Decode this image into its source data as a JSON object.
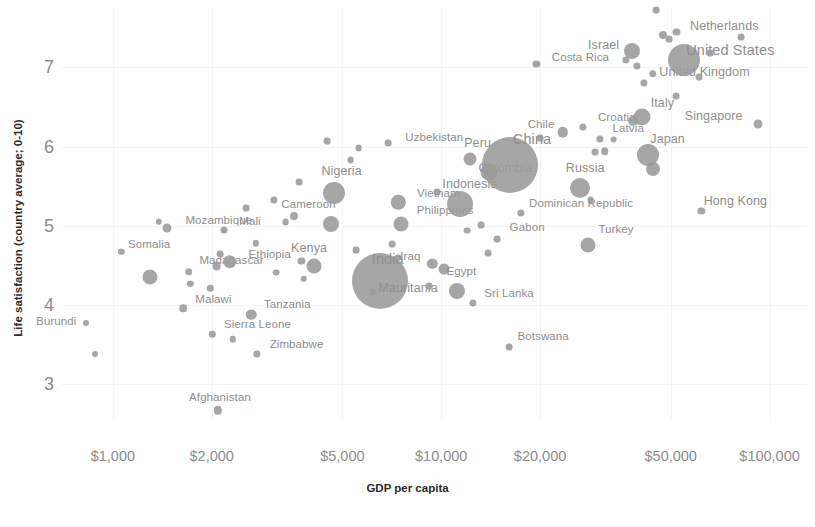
{
  "chart_data": {
    "type": "scatter",
    "title": "",
    "xlabel": "GDP per capita",
    "ylabel": "Life satisfaction (country average; 0-10)",
    "x_scale": "log",
    "xticks": [
      "$1,000",
      "$2,000",
      "$5,000",
      "$10,000",
      "$20,000",
      "$50,000",
      "$100,000"
    ],
    "xtick_values": [
      1000,
      2000,
      5000,
      10000,
      20000,
      50000,
      100000
    ],
    "yticks": [
      "3",
      "4",
      "5",
      "6",
      "7"
    ],
    "ytick_values": [
      3,
      4,
      5,
      6,
      7
    ],
    "xlim": [
      700,
      130000
    ],
    "ylim": [
      2.55,
      7.75
    ],
    "grid": true,
    "legend": null,
    "marker_color": "#9a9a9a",
    "label_color": "#8e8e8e",
    "size_encoding": "population",
    "points": [
      {
        "label": "Burundi",
        "gdp": 830,
        "life": 3.78,
        "r": 3.0,
        "lx": -30,
        "ly": -2,
        "cls": ""
      },
      {
        "label": "",
        "gdp": 880,
        "life": 3.38,
        "r": 3.0,
        "lx": 0,
        "ly": 0,
        "cls": ""
      },
      {
        "label": "Somalia",
        "gdp": 1060,
        "life": 4.67,
        "r": 3.2,
        "lx": 28,
        "ly": -8,
        "cls": ""
      },
      {
        "label": "",
        "gdp": 1300,
        "life": 4.35,
        "r": 7.5,
        "lx": 0,
        "ly": 0,
        "cls": ""
      },
      {
        "label": "Mozambique",
        "gdp": 1460,
        "life": 4.97,
        "r": 4.5,
        "lx": 52,
        "ly": -8,
        "cls": ""
      },
      {
        "label": "",
        "gdp": 1380,
        "life": 5.05,
        "r": 3.2,
        "lx": 0,
        "ly": 0,
        "cls": ""
      },
      {
        "label": "Malawi",
        "gdp": 1640,
        "life": 3.96,
        "r": 3.8,
        "lx": 30,
        "ly": -9,
        "cls": ""
      },
      {
        "label": "Madagascar",
        "gdp": 1700,
        "life": 4.42,
        "r": 3.8,
        "lx": 43,
        "ly": -12,
        "cls": ""
      },
      {
        "label": "",
        "gdp": 1720,
        "life": 4.27,
        "r": 3.2,
        "lx": 0,
        "ly": 0,
        "cls": ""
      },
      {
        "label": "",
        "gdp": 1980,
        "life": 4.21,
        "r": 3.2,
        "lx": 0,
        "ly": 0,
        "cls": ""
      },
      {
        "label": "Mali",
        "gdp": 2180,
        "life": 4.95,
        "r": 3.5,
        "lx": 26,
        "ly": -9,
        "cls": ""
      },
      {
        "label": "Ethiopia",
        "gdp": 2270,
        "life": 4.55,
        "r": 6.8,
        "lx": 40,
        "ly": -8,
        "cls": ""
      },
      {
        "label": "",
        "gdp": 2120,
        "life": 4.64,
        "r": 3.4,
        "lx": 0,
        "ly": 0,
        "cls": ""
      },
      {
        "label": "",
        "gdp": 2070,
        "life": 4.49,
        "r": 4.4,
        "lx": 0,
        "ly": 0,
        "cls": ""
      },
      {
        "label": "Sierra Leone",
        "gdp": 2010,
        "life": 3.63,
        "r": 3.2,
        "lx": 45,
        "ly": -10,
        "cls": ""
      },
      {
        "label": "",
        "gdp": 2320,
        "life": 3.57,
        "r": 3.2,
        "lx": 0,
        "ly": 0,
        "cls": ""
      },
      {
        "label": "Tanzania",
        "gdp": 2640,
        "life": 3.88,
        "r": 5.2,
        "lx": 36,
        "ly": -11,
        "cls": ""
      },
      {
        "label": "Zimbabwe",
        "gdp": 2740,
        "life": 3.38,
        "r": 3.6,
        "lx": 40,
        "ly": -10,
        "cls": ""
      },
      {
        "label": "Afghanistan",
        "gdp": 2090,
        "life": 2.67,
        "r": 4.2,
        "lx": 2,
        "ly": -13,
        "cls": ""
      },
      {
        "label": "",
        "gdp": 2540,
        "life": 5.22,
        "r": 3.4,
        "lx": 0,
        "ly": 0,
        "cls": ""
      },
      {
        "label": "",
        "gdp": 2720,
        "life": 4.78,
        "r": 3.2,
        "lx": 0,
        "ly": 0,
        "cls": ""
      },
      {
        "label": "",
        "gdp": 3100,
        "life": 5.33,
        "r": 3.6,
        "lx": 0,
        "ly": 0,
        "cls": ""
      },
      {
        "label": "",
        "gdp": 3150,
        "life": 4.41,
        "r": 3.4,
        "lx": 0,
        "ly": 0,
        "cls": ""
      },
      {
        "label": "Cameroon",
        "gdp": 3550,
        "life": 5.12,
        "r": 4.0,
        "lx": 15,
        "ly": -12,
        "cls": ""
      },
      {
        "label": "",
        "gdp": 3360,
        "life": 5.05,
        "r": 3.4,
        "lx": 0,
        "ly": 0,
        "cls": ""
      },
      {
        "label": "",
        "gdp": 3700,
        "life": 5.55,
        "r": 3.4,
        "lx": 0,
        "ly": 0,
        "cls": ""
      },
      {
        "label": "Nigeria",
        "gdp": 4700,
        "life": 5.42,
        "r": 11.0,
        "lx": 8,
        "ly": -22,
        "cls": "med"
      },
      {
        "label": "",
        "gdp": 4620,
        "life": 5.02,
        "r": 8.0,
        "lx": 0,
        "ly": 0,
        "cls": ""
      },
      {
        "label": "Kenya",
        "gdp": 4100,
        "life": 4.5,
        "r": 7.5,
        "lx": -5,
        "ly": -18,
        "cls": "med"
      },
      {
        "label": "",
        "gdp": 3750,
        "life": 4.56,
        "r": 3.6,
        "lx": 0,
        "ly": 0,
        "cls": ""
      },
      {
        "label": "",
        "gdp": 3820,
        "life": 4.33,
        "r": 3.2,
        "lx": 0,
        "ly": 0,
        "cls": ""
      },
      {
        "label": "",
        "gdp": 4500,
        "life": 6.07,
        "r": 3.4,
        "lx": 0,
        "ly": 0,
        "cls": ""
      },
      {
        "label": "",
        "gdp": 5300,
        "life": 5.83,
        "r": 3.4,
        "lx": 0,
        "ly": 0,
        "cls": ""
      },
      {
        "label": "",
        "gdp": 5600,
        "life": 5.98,
        "r": 3.4,
        "lx": 0,
        "ly": 0,
        "cls": ""
      },
      {
        "label": "India",
        "gdp": 6500,
        "life": 4.31,
        "r": 28.0,
        "lx": 8,
        "ly": -22,
        "cls": "big"
      },
      {
        "label": "Mauritania",
        "gdp": 6200,
        "life": 4.17,
        "r": 3.6,
        "lx": 35,
        "ly": -4,
        "cls": "med"
      },
      {
        "label": "",
        "gdp": 5500,
        "life": 4.69,
        "r": 3.4,
        "lx": 0,
        "ly": 0,
        "cls": ""
      },
      {
        "label": "",
        "gdp": 7100,
        "life": 4.77,
        "r": 3.4,
        "lx": 0,
        "ly": 0,
        "cls": ""
      },
      {
        "label": "",
        "gdp": 7400,
        "life": 4.6,
        "r": 3.4,
        "lx": 0,
        "ly": 0,
        "cls": ""
      },
      {
        "label": "Vietnam",
        "gdp": 7400,
        "life": 5.3,
        "r": 7.2,
        "lx": 40,
        "ly": -9,
        "cls": ""
      },
      {
        "label": "Philippines",
        "gdp": 7550,
        "life": 5.02,
        "r": 7.5,
        "lx": 44,
        "ly": -14,
        "cls": ""
      },
      {
        "label": "Uzbekistan",
        "gdp": 6900,
        "life": 6.04,
        "r": 3.4,
        "lx": 46,
        "ly": -6,
        "cls": ""
      },
      {
        "label": "Iraq",
        "gdp": 9400,
        "life": 4.52,
        "r": 5.2,
        "lx": -22,
        "ly": -8,
        "cls": ""
      },
      {
        "label": "",
        "gdp": 10200,
        "life": 4.45,
        "r": 5.5,
        "lx": 0,
        "ly": 0,
        "cls": ""
      },
      {
        "label": "",
        "gdp": 9200,
        "life": 4.24,
        "r": 3.4,
        "lx": 0,
        "ly": 0,
        "cls": ""
      },
      {
        "label": "Egypt",
        "gdp": 11200,
        "life": 4.18,
        "r": 8.0,
        "lx": 4,
        "ly": -20,
        "cls": ""
      },
      {
        "label": "Sri Lanka",
        "gdp": 12500,
        "life": 4.03,
        "r": 3.6,
        "lx": 36,
        "ly": -10,
        "cls": ""
      },
      {
        "label": "Indonesia",
        "gdp": 11400,
        "life": 5.28,
        "r": 13.0,
        "lx": 10,
        "ly": -20,
        "cls": "med"
      },
      {
        "label": "",
        "gdp": 9700,
        "life": 5.43,
        "r": 3.4,
        "lx": 0,
        "ly": 0,
        "cls": ""
      },
      {
        "label": "Peru",
        "gdp": 12200,
        "life": 5.84,
        "r": 6.5,
        "lx": 8,
        "ly": -16,
        "cls": "med"
      },
      {
        "label": "Colombia",
        "gdp": 14000,
        "life": 5.68,
        "r": 8.5,
        "lx": 16,
        "ly": -4,
        "cls": "med"
      },
      {
        "label": "China",
        "gdp": 16200,
        "life": 5.77,
        "r": 28.0,
        "lx": 22,
        "ly": -26,
        "cls": "big"
      },
      {
        "label": "",
        "gdp": 13200,
        "life": 5.01,
        "r": 3.4,
        "lx": 0,
        "ly": 0,
        "cls": ""
      },
      {
        "label": "Gabon",
        "gdp": 14800,
        "life": 4.83,
        "r": 3.4,
        "lx": 30,
        "ly": -12,
        "cls": ""
      },
      {
        "label": "",
        "gdp": 13900,
        "life": 4.66,
        "r": 3.4,
        "lx": 0,
        "ly": 0,
        "cls": ""
      },
      {
        "label": "",
        "gdp": 12000,
        "life": 4.94,
        "r": 3.4,
        "lx": 0,
        "ly": 0,
        "cls": ""
      },
      {
        "label": "Dominican Republic",
        "gdp": 17500,
        "life": 5.16,
        "r": 3.6,
        "lx": 60,
        "ly": -10,
        "cls": ""
      },
      {
        "label": "Botswana",
        "gdp": 16100,
        "life": 3.47,
        "r": 3.4,
        "lx": 34,
        "ly": -11,
        "cls": ""
      },
      {
        "label": "Chile",
        "gdp": 23500,
        "life": 6.18,
        "r": 5.2,
        "lx": -22,
        "ly": -8,
        "cls": ""
      },
      {
        "label": "",
        "gdp": 20000,
        "life": 6.11,
        "r": 3.4,
        "lx": 0,
        "ly": 0,
        "cls": ""
      },
      {
        "label": "Russia",
        "gdp": 26500,
        "life": 5.48,
        "r": 10.0,
        "lx": 5,
        "ly": -20,
        "cls": "med"
      },
      {
        "label": "",
        "gdp": 28500,
        "life": 5.33,
        "r": 3.4,
        "lx": 0,
        "ly": 0,
        "cls": ""
      },
      {
        "label": "Turkey",
        "gdp": 28000,
        "life": 4.76,
        "r": 7.5,
        "lx": 28,
        "ly": -16,
        "cls": ""
      },
      {
        "label": "Costa Rica",
        "gdp": 19500,
        "life": 7.04,
        "r": 3.6,
        "lx": 44,
        "ly": -7,
        "cls": ""
      },
      {
        "label": "Croatia",
        "gdp": 27000,
        "life": 6.25,
        "r": 3.6,
        "lx": 34,
        "ly": -10,
        "cls": ""
      },
      {
        "label": "Latvia",
        "gdp": 30500,
        "life": 6.1,
        "r": 3.6,
        "lx": 28,
        "ly": -11,
        "cls": ""
      },
      {
        "label": "",
        "gdp": 31500,
        "life": 5.94,
        "r": 3.8,
        "lx": 0,
        "ly": 0,
        "cls": ""
      },
      {
        "label": "",
        "gdp": 29500,
        "life": 5.93,
        "r": 3.4,
        "lx": 0,
        "ly": 0,
        "cls": ""
      },
      {
        "label": "",
        "gdp": 33500,
        "life": 6.09,
        "r": 3.4,
        "lx": 0,
        "ly": 0,
        "cls": ""
      },
      {
        "label": "Italy",
        "gdp": 41000,
        "life": 6.38,
        "r": 8.5,
        "lx": 20,
        "ly": -14,
        "cls": "med"
      },
      {
        "label": "",
        "gdp": 38500,
        "life": 6.33,
        "r": 5.0,
        "lx": 0,
        "ly": 0,
        "cls": ""
      },
      {
        "label": "Israel",
        "gdp": 38000,
        "life": 7.21,
        "r": 8.0,
        "lx": -28,
        "ly": -6,
        "cls": "med"
      },
      {
        "label": "",
        "gdp": 36500,
        "life": 7.1,
        "r": 3.6,
        "lx": 0,
        "ly": 0,
        "cls": ""
      },
      {
        "label": "",
        "gdp": 39500,
        "life": 7.02,
        "r": 3.6,
        "lx": 0,
        "ly": 0,
        "cls": ""
      },
      {
        "label": "United Kingdom",
        "gdp": 44000,
        "life": 6.92,
        "r": 3.8,
        "lx": 52,
        "ly": -2,
        "cls": "med"
      },
      {
        "label": "",
        "gdp": 41500,
        "life": 6.8,
        "r": 3.6,
        "lx": 0,
        "ly": 0,
        "cls": ""
      },
      {
        "label": "Netherlands",
        "gdp": 52000,
        "life": 7.45,
        "r": 3.6,
        "lx": 48,
        "ly": -6,
        "cls": "med"
      },
      {
        "label": "",
        "gdp": 47500,
        "life": 7.41,
        "r": 4.0,
        "lx": 0,
        "ly": 0,
        "cls": ""
      },
      {
        "label": "",
        "gdp": 49500,
        "life": 7.36,
        "r": 3.4,
        "lx": 0,
        "ly": 0,
        "cls": ""
      },
      {
        "label": "",
        "gdp": 45000,
        "life": 7.72,
        "r": 3.4,
        "lx": 0,
        "ly": 0,
        "cls": ""
      },
      {
        "label": "United States",
        "gdp": 55000,
        "life": 7.1,
        "r": 16.0,
        "lx": 46,
        "ly": -10,
        "cls": "big"
      },
      {
        "label": "",
        "gdp": 61000,
        "life": 6.88,
        "r": 3.4,
        "lx": 0,
        "ly": 0,
        "cls": ""
      },
      {
        "label": "",
        "gdp": 66000,
        "life": 7.18,
        "r": 3.4,
        "lx": 0,
        "ly": 0,
        "cls": ""
      },
      {
        "label": "",
        "gdp": 82000,
        "life": 7.38,
        "r": 3.4,
        "lx": 0,
        "ly": 0,
        "cls": ""
      },
      {
        "label": "Japan",
        "gdp": 42500,
        "life": 5.9,
        "r": 11.0,
        "lx": 20,
        "ly": -16,
        "cls": "med"
      },
      {
        "label": "",
        "gdp": 44000,
        "life": 5.72,
        "r": 7.0,
        "lx": 0,
        "ly": 0,
        "cls": ""
      },
      {
        "label": "Singapore",
        "gdp": 92000,
        "life": 6.28,
        "r": 4.5,
        "lx": -44,
        "ly": -8,
        "cls": "med"
      },
      {
        "label": "Hong Kong",
        "gdp": 62000,
        "life": 5.19,
        "r": 3.6,
        "lx": 34,
        "ly": -10,
        "cls": "med"
      },
      {
        "label": "",
        "gdp": 52000,
        "life": 6.64,
        "r": 3.4,
        "lx": 0,
        "ly": 0,
        "cls": ""
      }
    ]
  }
}
